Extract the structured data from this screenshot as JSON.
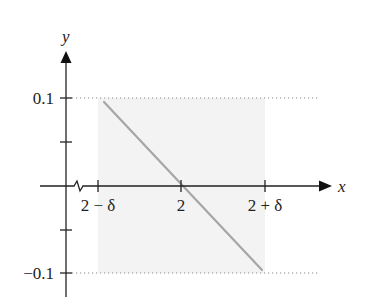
{
  "diagram": {
    "axes": {
      "x_label": "x",
      "y_label": "y"
    },
    "y_ticks": [
      {
        "label": "0.1",
        "value": 0.1
      },
      {
        "label": "",
        "value": 0.05
      },
      {
        "label": "",
        "value": -0.05
      },
      {
        "label": "−0.1",
        "value": -0.1
      }
    ],
    "x_ticks": [
      {
        "label": "2 − δ",
        "value": "2-delta"
      },
      {
        "label": "2",
        "value": 2
      },
      {
        "label": "2 + δ",
        "value": "2+delta"
      }
    ],
    "shaded_region": {
      "x_from": "2 − δ",
      "x_to": "2 + δ",
      "y_from": -0.1,
      "y_to": 0.1,
      "color": "#f2f2f2"
    },
    "line": {
      "description": "decreasing line passing through (2, 0)",
      "from": [
        "2 − δ",
        0.1
      ],
      "to": [
        "2 + δ",
        -0.1
      ],
      "color": "#a6a6a6"
    },
    "guide_lines": [
      {
        "y": 0.1,
        "style": "dotted"
      },
      {
        "y": -0.1,
        "style": "dotted"
      }
    ],
    "axis_break": "zigzag on x-axis near origin",
    "colors": {
      "axis": "#222222",
      "line": "#a6a6a6",
      "shade": "#f2f2f2",
      "dotted": "#888888"
    }
  }
}
